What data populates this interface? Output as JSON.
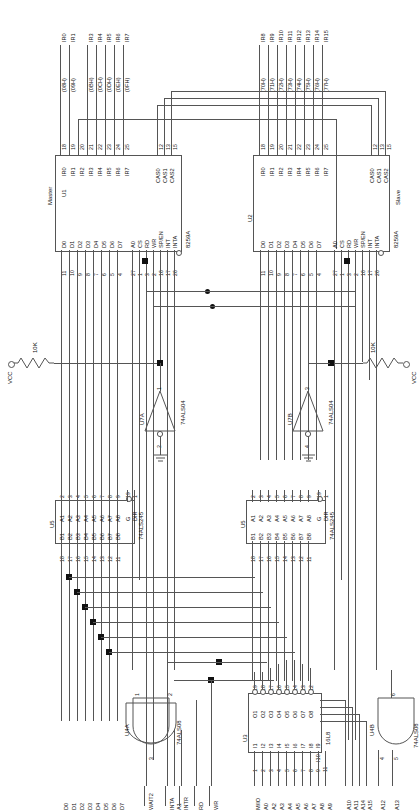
{
  "master": {
    "ref": "U1",
    "part": "8259A",
    "role": "Master",
    "irq_inputs": [
      {
        "name": "IR0",
        "pin": "18",
        "net": "IR0",
        "addr": "(08H)"
      },
      {
        "name": "IR1",
        "pin": "19",
        "net": "IR1",
        "addr": "(09H)"
      },
      {
        "name": "IR2",
        "pin": "20",
        "net": "",
        "addr": ""
      },
      {
        "name": "IR3",
        "pin": "21",
        "net": "IR3",
        "addr": "(0BH)"
      },
      {
        "name": "IR4",
        "pin": "22",
        "net": "IR4",
        "addr": "(0CH)"
      },
      {
        "name": "IR5",
        "pin": "23",
        "net": "IR5",
        "addr": "(0DH)"
      },
      {
        "name": "IR6",
        "pin": "24",
        "net": "IR6",
        "addr": "(0EH)"
      },
      {
        "name": "IR7",
        "pin": "25",
        "net": "IR7",
        "addr": "(0FH)"
      }
    ],
    "cascade": [
      {
        "name": "CAS0",
        "pin": "12"
      },
      {
        "name": "CAS1",
        "pin": "13"
      },
      {
        "name": "CAS2",
        "pin": "15"
      }
    ],
    "data_pins": [
      {
        "name": "D0",
        "pin": "11"
      },
      {
        "name": "D1",
        "pin": "10"
      },
      {
        "name": "D2",
        "pin": "9"
      },
      {
        "name": "D3",
        "pin": "8"
      },
      {
        "name": "D4",
        "pin": "7"
      },
      {
        "name": "D5",
        "pin": "6"
      },
      {
        "name": "D6",
        "pin": "5"
      },
      {
        "name": "D7",
        "pin": "4"
      }
    ],
    "ctrl_pins": [
      {
        "name": "A0",
        "pin": "27"
      },
      {
        "name": "CS",
        "pin": "1"
      },
      {
        "name": "RD",
        "pin": "3"
      },
      {
        "name": "WR",
        "pin": "2"
      },
      {
        "name": "SP/EN",
        "pin": "16"
      },
      {
        "name": "INT",
        "pin": "17"
      },
      {
        "name": "INTA",
        "pin": "26"
      }
    ]
  },
  "slave": {
    "ref": "U2",
    "part": "8259A",
    "role": "Slave",
    "irq_inputs": [
      {
        "name": "IR0",
        "pin": "18",
        "net": "IR8",
        "addr": "(70H)"
      },
      {
        "name": "IR1",
        "pin": "19",
        "net": "IR9",
        "addr": "(71H)"
      },
      {
        "name": "IR2",
        "pin": "20",
        "net": "IR10",
        "addr": "(72H)"
      },
      {
        "name": "IR3",
        "pin": "21",
        "net": "IR11",
        "addr": "(73H)"
      },
      {
        "name": "IR4",
        "pin": "22",
        "net": "IR12",
        "addr": "(74H)"
      },
      {
        "name": "IR5",
        "pin": "23",
        "net": "IR13",
        "addr": "(75H)"
      },
      {
        "name": "IR6",
        "pin": "24",
        "net": "IR14",
        "addr": "(76H)"
      },
      {
        "name": "IR7",
        "pin": "25",
        "net": "IR15",
        "addr": "(77H)"
      }
    ],
    "cascade": [
      {
        "name": "CAS0",
        "pin": "12"
      },
      {
        "name": "CAS1",
        "pin": "13"
      },
      {
        "name": "CAS2",
        "pin": "15"
      }
    ],
    "data_pins": [
      {
        "name": "D0",
        "pin": "11"
      },
      {
        "name": "D1",
        "pin": "10"
      },
      {
        "name": "D2",
        "pin": "9"
      },
      {
        "name": "D3",
        "pin": "8"
      },
      {
        "name": "D4",
        "pin": "7"
      },
      {
        "name": "D5",
        "pin": "6"
      },
      {
        "name": "D6",
        "pin": "5"
      },
      {
        "name": "D7",
        "pin": "4"
      }
    ],
    "ctrl_pins": [
      {
        "name": "A0",
        "pin": "27"
      },
      {
        "name": "CS",
        "pin": "1"
      },
      {
        "name": "RD",
        "pin": "3"
      },
      {
        "name": "WR",
        "pin": "2"
      },
      {
        "name": "SP/EN",
        "pin": "16"
      },
      {
        "name": "INT",
        "pin": "17"
      },
      {
        "name": "INTA",
        "pin": "26"
      }
    ]
  },
  "pullup_left": {
    "label": "VCC",
    "value": "10K"
  },
  "pullup_right": {
    "label": "VCC",
    "value": "10K"
  },
  "inv_left": {
    "ref": "U7A",
    "part": "74ALS04",
    "in_pin": "1",
    "out_pin": "2"
  },
  "inv_right": {
    "ref": "U7B",
    "part": "74ALS04",
    "in_pin": "3",
    "out_pin": "4"
  },
  "buf_left": {
    "ref": "U5",
    "part": "74ALS245",
    "a_pins": [
      {
        "name": "A1",
        "pin": "2"
      },
      {
        "name": "A2",
        "pin": "3"
      },
      {
        "name": "A3",
        "pin": "4"
      },
      {
        "name": "A4",
        "pin": "5"
      },
      {
        "name": "A5",
        "pin": "6"
      },
      {
        "name": "A6",
        "pin": "7"
      },
      {
        "name": "A7",
        "pin": "8"
      },
      {
        "name": "A8",
        "pin": "9"
      }
    ],
    "b_pins": [
      {
        "name": "B1",
        "pin": "18"
      },
      {
        "name": "B2",
        "pin": "17"
      },
      {
        "name": "B3",
        "pin": "16"
      },
      {
        "name": "B4",
        "pin": "15"
      },
      {
        "name": "B5",
        "pin": "14"
      },
      {
        "name": "B6",
        "pin": "13"
      },
      {
        "name": "B7",
        "pin": "12"
      },
      {
        "name": "B8",
        "pin": "11"
      }
    ],
    "g_pin": "19",
    "g_name": "G",
    "dir_pin": "1",
    "dir_name": "DIR"
  },
  "buf_right": {
    "ref": "U5",
    "part": "74ALS245",
    "a_pins": [
      {
        "name": "A1",
        "pin": "2"
      },
      {
        "name": "A2",
        "pin": "3"
      },
      {
        "name": "A3",
        "pin": "4"
      },
      {
        "name": "A4",
        "pin": "5"
      },
      {
        "name": "A5",
        "pin": "6"
      },
      {
        "name": "A6",
        "pin": "7"
      },
      {
        "name": "A7",
        "pin": "8"
      },
      {
        "name": "A8",
        "pin": "9"
      }
    ],
    "b_pins": [
      {
        "name": "B1",
        "pin": "18"
      },
      {
        "name": "B2",
        "pin": "17"
      },
      {
        "name": "B3",
        "pin": "16"
      },
      {
        "name": "B4",
        "pin": "15"
      },
      {
        "name": "B5",
        "pin": "14"
      },
      {
        "name": "B6",
        "pin": "13"
      },
      {
        "name": "B7",
        "pin": "12"
      },
      {
        "name": "B8",
        "pin": "11"
      }
    ],
    "g_pin": "19",
    "g_name": "G",
    "dir_pin": "1",
    "dir_name": "DIR"
  },
  "pal": {
    "ref": "U3",
    "part": "16L8",
    "inputs": [
      {
        "name": "I1",
        "pin": "1",
        "net": "M/IO"
      },
      {
        "name": "I2",
        "pin": "2",
        "net": "A0"
      },
      {
        "name": "I3",
        "pin": "3",
        "net": "A2"
      },
      {
        "name": "I4",
        "pin": "4",
        "net": "A3"
      },
      {
        "name": "I5",
        "pin": "5",
        "net": "A4"
      },
      {
        "name": "I6",
        "pin": "6",
        "net": "A5"
      },
      {
        "name": "I7",
        "pin": "7",
        "net": "A6"
      },
      {
        "name": "I8",
        "pin": "8",
        "net": "A7"
      },
      {
        "name": "I9",
        "pin": "9",
        "net": "A8"
      },
      {
        "name": "I10",
        "pin": "11",
        "net": "A9"
      }
    ],
    "outputs": [
      {
        "name": "O1",
        "pin": "19"
      },
      {
        "name": "O2",
        "pin": "18"
      },
      {
        "name": "O3",
        "pin": "17"
      },
      {
        "name": "O4",
        "pin": "16"
      },
      {
        "name": "O5",
        "pin": "15"
      },
      {
        "name": "O6",
        "pin": "14"
      },
      {
        "name": "O7",
        "pin": "13"
      },
      {
        "name": "O8",
        "pin": "12"
      }
    ]
  },
  "and_left": {
    "ref": "U4A",
    "part": "74ALS08",
    "in1_pin": "1",
    "in2_pin": "2",
    "out_pin": "3"
  },
  "and_right": {
    "ref": "U4B",
    "part": "74ALS08",
    "in1_pin": "4",
    "in2_pin": "5",
    "out_pin": "6",
    "in1_net": "A12",
    "in2_net": "A13"
  },
  "bus_labels": {
    "data": [
      "D0",
      "D1",
      "D2",
      "D3",
      "D4",
      "D5",
      "D6",
      "D7"
    ],
    "wait": "WAIT2",
    "ctrl": [
      "INTA",
      "A1",
      "INTR",
      "RD",
      "WR"
    ],
    "addr_low": [
      "M/IO",
      "A0",
      "A2",
      "A3",
      "A4",
      "A5",
      "A6",
      "A7",
      "A8",
      "A9"
    ],
    "addr_high": [
      "A10",
      "A11",
      "A14",
      "A15"
    ],
    "and_right_in": [
      "A12",
      "A13"
    ]
  },
  "colors": {
    "wire": "#555555",
    "text": "#111111",
    "background": "#ffffff"
  }
}
